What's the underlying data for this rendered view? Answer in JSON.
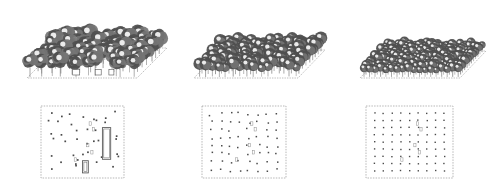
{
  "figure": {
    "title": "Urban forest density scenarios",
    "background_color": "#ffffff",
    "layout": "3 columns x 2 rows",
    "row_top_label": "isometric canopy view",
    "row_bottom_label": "plan footprint view",
    "canvas_width": 491,
    "canvas_height": 191
  },
  "palette": {
    "canopy_dark": "#4f4f4f",
    "canopy_mid": "#757575",
    "canopy_light": "#a8a8a8",
    "canopy_highlight": "#f2f2f2",
    "trunk": "#6b6b6b",
    "ground_edge": "#8a8a8a",
    "plan_border": "#9a9a9a",
    "plan_dot": "#4a4a4a",
    "building_stroke": "#555555",
    "building_fill": "#ffffff"
  },
  "chart_data": {
    "type": "scatter",
    "title": "Urban forest density scenarios",
    "xlabel": "",
    "ylabel": "",
    "legend_position": "none",
    "grid": false,
    "panels": [
      {
        "id": "scenario-a",
        "label": "",
        "position": "left",
        "tree_count": 96,
        "grid_cols": 12,
        "grid_rows": 8,
        "regularity": 0.35,
        "canopy_radius": 7.2,
        "canopy_style": "spiky",
        "building_count": 2,
        "buildings": [
          {
            "x": 0.74,
            "y": 0.3,
            "w": 0.1,
            "h": 0.44
          },
          {
            "x": 0.5,
            "y": 0.76,
            "w": 0.07,
            "h": 0.17
          }
        ],
        "plan_dots": 48,
        "iso": {
          "cx": 168,
          "cy": 66,
          "hw": 112,
          "hh": 34,
          "skew": 74
        }
      },
      {
        "id": "scenario-b",
        "label": "",
        "position": "center",
        "tree_count": 150,
        "grid_cols": 15,
        "grid_rows": 10,
        "regularity": 0.72,
        "canopy_radius": 5.4,
        "canopy_style": "round",
        "building_count": 0,
        "buildings": [],
        "plan_dots": 72,
        "iso": {
          "cx": 330,
          "cy": 70,
          "hw": 104,
          "hh": 31,
          "skew": 68
        }
      },
      {
        "id": "scenario-c",
        "label": "",
        "position": "right",
        "tree_count": 216,
        "grid_cols": 18,
        "grid_rows": 12,
        "regularity": 0.94,
        "canopy_radius": 4.1,
        "canopy_style": "round",
        "building_count": 0,
        "buildings": [],
        "plan_dots": 90,
        "iso": {
          "cx": 492,
          "cy": 72,
          "hw": 100,
          "hh": 29,
          "skew": 64
        }
      }
    ]
  },
  "panels_ui": [
    {
      "name": "panel-left",
      "iso_name": "isometric-view-a",
      "plan_name": "plan-view-a"
    },
    {
      "name": "panel-center",
      "iso_name": "isometric-view-b",
      "plan_name": "plan-view-b"
    },
    {
      "name": "panel-right",
      "iso_name": "isometric-view-c",
      "plan_name": "plan-view-c"
    }
  ]
}
